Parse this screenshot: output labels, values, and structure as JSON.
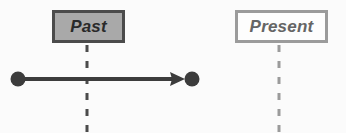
{
  "diagram": {
    "title_visible": false,
    "background_color": "#fbfbfb",
    "canvas": {
      "width": 346,
      "height": 133
    },
    "eras": [
      {
        "id": "past",
        "label": "Past",
        "fill_color": "#a9a9a9",
        "border_color": "#4b4b4b",
        "text_color": "#2a2a2a",
        "boundary_x": 87
      },
      {
        "id": "present",
        "label": "Present",
        "fill_color": "#fdfdfd",
        "border_color": "#9b9b9b",
        "text_color": "#656565",
        "boundary_x": 279
      }
    ],
    "boundaries": [
      {
        "id": "past-boundary",
        "x": 87,
        "y_top": 45,
        "y_bottom": 132,
        "color": "#4b4b4b",
        "stroke_width": 3,
        "dash": "7 9"
      },
      {
        "id": "present-boundary",
        "x": 279,
        "y_top": 45,
        "y_bottom": 132,
        "color": "#9b9b9b",
        "stroke_width": 3,
        "dash": "7 9"
      }
    ],
    "interval": {
      "id": "past-interval",
      "color": "#3c3c3c",
      "stroke_width": 4,
      "y": 79,
      "start_x": 18,
      "end_x": 192,
      "arrow_tip_x": 185,
      "start_marker": "filled-circle",
      "end_marker": "filled-circle",
      "arrowhead": "solid-triangle",
      "marker_radius": 7
    }
  }
}
